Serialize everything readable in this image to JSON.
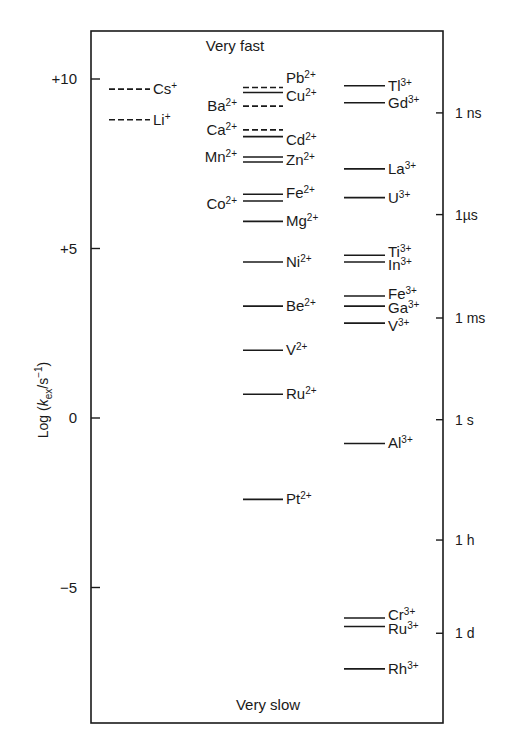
{
  "chart_data": {
    "type": "line",
    "subtype": "level-diagram",
    "title": "",
    "top_annotation": "Very fast",
    "bottom_annotation": "Very slow",
    "ylabel": "Log (k_ex/s⁻¹)",
    "ylabel_parts": {
      "pre": "Log (",
      "k": "k",
      "sub": "ex",
      "mid": "/s",
      "sup": "−1",
      "post": ")"
    },
    "ylim": [
      -8.9,
      11.5
    ],
    "left_ticks": [
      {
        "value": 10,
        "label": "+10"
      },
      {
        "value": 5,
        "label": "+5"
      },
      {
        "value": 0,
        "label": "0"
      },
      {
        "value": -5,
        "label": "−5"
      }
    ],
    "right_ticks": [
      {
        "value": 9.0,
        "label": "1 ns"
      },
      {
        "value": 6.0,
        "label": "1µs"
      },
      {
        "value": 2.95,
        "label": "1 ms"
      },
      {
        "value": -0.05,
        "label": "1 s"
      },
      {
        "value": -3.6,
        "label": "1 h"
      },
      {
        "value": -6.35,
        "label": "1 d"
      }
    ],
    "columns": [
      {
        "name": "monovalent",
        "ions": [
          {
            "ion": "Cs",
            "charge": "+",
            "value": 9.7,
            "style": "dashed",
            "label_side": "right"
          },
          {
            "ion": "Li",
            "charge": "+",
            "value": 8.8,
            "style": "dashed",
            "label_side": "right"
          }
        ]
      },
      {
        "name": "divalent",
        "ions": [
          {
            "ion": "Pb",
            "charge": "2+",
            "value": 9.75,
            "style": "dashed",
            "label_side": "right"
          },
          {
            "ion": "Cu",
            "charge": "2+",
            "value": 9.6,
            "style": "solid",
            "label_side": "right"
          },
          {
            "ion": "Ba",
            "charge": "2+",
            "value": 9.2,
            "style": "dashed",
            "label_side": "left"
          },
          {
            "ion": "Ca",
            "charge": "2+",
            "value": 8.5,
            "style": "dashed",
            "label_side": "left"
          },
          {
            "ion": "Cd",
            "charge": "2+",
            "value": 8.3,
            "style": "solid",
            "label_side": "right"
          },
          {
            "ion": "Mn",
            "charge": "2+",
            "value": 7.7,
            "style": "solid",
            "label_side": "left"
          },
          {
            "ion": "Zn",
            "charge": "2+",
            "value": 7.55,
            "style": "solid",
            "label_side": "right"
          },
          {
            "ion": "Fe",
            "charge": "2+",
            "value": 6.6,
            "style": "solid",
            "label_side": "right"
          },
          {
            "ion": "Co",
            "charge": "2+",
            "value": 6.4,
            "style": "solid",
            "label_side": "left"
          },
          {
            "ion": "Mg",
            "charge": "2+",
            "value": 5.8,
            "style": "solid",
            "label_side": "right"
          },
          {
            "ion": "Ni",
            "charge": "2+",
            "value": 4.6,
            "style": "solid",
            "label_side": "right"
          },
          {
            "ion": "Be",
            "charge": "2+",
            "value": 3.3,
            "style": "solid",
            "label_side": "right"
          },
          {
            "ion": "V",
            "charge": "2+",
            "value": 2.0,
            "style": "solid",
            "label_side": "right"
          },
          {
            "ion": "Ru",
            "charge": "2+",
            "value": 0.7,
            "style": "solid",
            "label_side": "right"
          },
          {
            "ion": "Pt",
            "charge": "2+",
            "value": -2.4,
            "style": "solid",
            "label_side": "right"
          }
        ]
      },
      {
        "name": "trivalent",
        "ions": [
          {
            "ion": "Tl",
            "charge": "3+",
            "value": 9.8,
            "style": "solid",
            "label_side": "right"
          },
          {
            "ion": "Gd",
            "charge": "3+",
            "value": 9.3,
            "style": "solid",
            "label_side": "right"
          },
          {
            "ion": "La",
            "charge": "3+",
            "value": 7.35,
            "style": "solid",
            "label_side": "right"
          },
          {
            "ion": "U",
            "charge": "3+",
            "value": 6.5,
            "style": "solid",
            "label_side": "right"
          },
          {
            "ion": "Ti",
            "charge": "3+",
            "value": 4.8,
            "style": "solid",
            "label_side": "right"
          },
          {
            "ion": "In",
            "charge": "3+",
            "value": 4.6,
            "style": "solid",
            "label_side": "right"
          },
          {
            "ion": "Fe",
            "charge": "3+",
            "value": 3.6,
            "style": "solid",
            "label_side": "right"
          },
          {
            "ion": "Ga",
            "charge": "3+",
            "value": 3.3,
            "style": "solid",
            "label_side": "right"
          },
          {
            "ion": "V",
            "charge": "3+",
            "value": 2.8,
            "style": "solid",
            "label_side": "right"
          },
          {
            "ion": "Al",
            "charge": "3+",
            "value": -0.75,
            "style": "solid",
            "label_side": "right"
          },
          {
            "ion": "Cr",
            "charge": "3+",
            "value": -5.9,
            "style": "solid",
            "label_side": "right"
          },
          {
            "ion": "Ru",
            "charge": "3+",
            "value": -6.15,
            "style": "solid",
            "label_side": "right"
          },
          {
            "ion": "Rh",
            "charge": "3+",
            "value": -7.4,
            "style": "solid",
            "label_side": "right"
          }
        ]
      }
    ],
    "grid": false,
    "legend": "none"
  }
}
